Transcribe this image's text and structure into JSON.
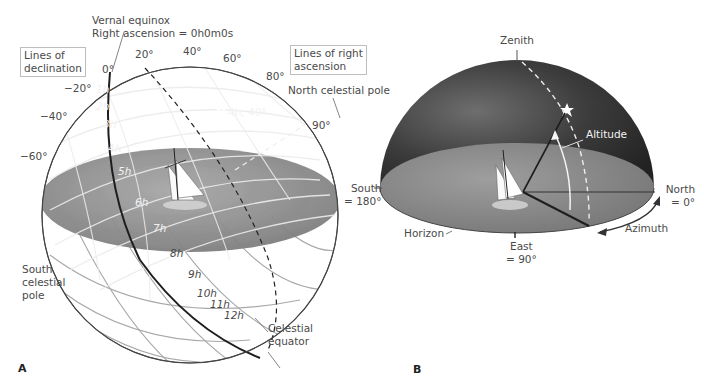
{
  "figure": {
    "panels": [
      {
        "id": "A",
        "letter": "A",
        "title": "Equatorial coordinate system (celestial sphere)",
        "labels": {
          "vernal_equinox_line1": "Vernal equinox",
          "vernal_equinox_line2": "Right ascension = 0h0m0s",
          "lines_of_declination_line1": "Lines of",
          "lines_of_declination_line2": "declination",
          "lines_of_ra_line1": "Lines of right",
          "lines_of_ra_line2": "ascension",
          "north_celestial_pole": "North celestial pole",
          "south_celestial_pole_line1": "South",
          "south_celestial_pole_line2": "celestial",
          "south_celestial_pole_line3": "pole",
          "celestial_equator_line1": "Celestial",
          "celestial_equator_line2": "equator",
          "star_coordinates": "4h, 40°"
        },
        "declination_ticks": [
          "0°",
          "20°",
          "40°",
          "60°",
          "80°",
          "90°",
          "−20°",
          "−40°",
          "−60°"
        ],
        "ra_ticks": [
          "1h",
          "2h",
          "3h",
          "4h",
          "5h",
          "6h",
          "7h",
          "8h",
          "9h",
          "10h",
          "11h",
          "12h"
        ]
      },
      {
        "id": "B",
        "letter": "B",
        "title": "Horizon coordinate system",
        "labels": {
          "zenith": "Zenith",
          "altitude": "Altitude",
          "azimuth": "Azimuth",
          "horizon": "Horizon",
          "north_line1": "North",
          "north_line2": "= 0°",
          "south_line1": "South",
          "south_line2": "= 180°",
          "east_line1": "East",
          "east_line2": "= 90°"
        }
      }
    ],
    "colors": {
      "sky_dark": "#2b2b2b",
      "sky_mid": "#5a5a5a",
      "horizon_plane": "#8c8c8c",
      "grid_line": "#e8e8e8",
      "lower_sphere_line": "#9a9a9a",
      "equator_line": "#222222",
      "label_text": "#4a4a4a"
    }
  }
}
